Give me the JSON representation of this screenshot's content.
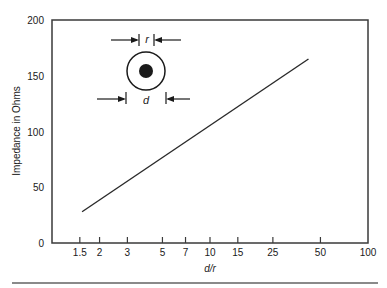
{
  "chart_data": {
    "type": "line",
    "title": "",
    "xlabel": "d/r",
    "ylabel": "Impedance in Ohms",
    "xscale": "log",
    "xlim": [
      1,
      100
    ],
    "ylim": [
      0,
      200
    ],
    "xticks": [
      1.5,
      2,
      3,
      5,
      7,
      10,
      15,
      25,
      50,
      100
    ],
    "xtick_labels": [
      "1.5",
      "2",
      "3",
      "5",
      "7",
      "10",
      "15",
      "25",
      "50",
      "100"
    ],
    "yticks": [
      0,
      50,
      100,
      150,
      200
    ],
    "ytick_labels": [
      "0",
      "50",
      "100",
      "150",
      "200"
    ],
    "grid": false,
    "legend": null,
    "series": [
      {
        "name": "Coaxial line impedance",
        "x": [
          1.55,
          42
        ],
        "y": [
          28,
          165
        ]
      }
    ],
    "annotations": [
      {
        "type": "inset-diagram",
        "label": "coaxial cross-section",
        "dimension_labels": [
          "r",
          "d"
        ]
      }
    ]
  },
  "diagram": {
    "r_label": "r",
    "d_label": "d"
  },
  "colors": {
    "line": "#2a2a2a",
    "axis": "#3a3a3a",
    "separator": "#8a8a8a"
  }
}
